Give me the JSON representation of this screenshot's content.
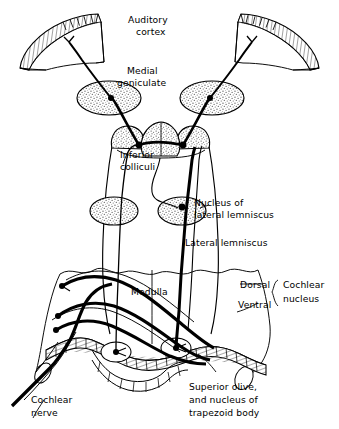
{
  "figure": {
    "type": "anatomical-diagram",
    "background_color": "#ffffff",
    "ink_color": "#000000",
    "stipple_color": "#7a7a7a",
    "width": 339,
    "height": 429
  },
  "labels": {
    "auditory_cortex": {
      "line1": "Auditory",
      "line2": "cortex"
    },
    "medial_geniculate": {
      "line1": "Medial",
      "line2": "geniculate"
    },
    "inferior_colliculi": {
      "line1": "Inferior",
      "line2": "colliculi"
    },
    "nucleus_lateral_lemniscus": {
      "line1": "Nucleus of",
      "line2": "lateral lemniscus"
    },
    "lateral_lemniscus": {
      "line1": "Lateral lemniscus"
    },
    "medulla": {
      "line1": "Medulla"
    },
    "dorsal": {
      "line1": "Dorsal"
    },
    "ventral": {
      "line1": "Ventral"
    },
    "cochlear_nucleus": {
      "line1": "Cochlear",
      "line2": "nucleus"
    },
    "cochlear_nerve": {
      "line1": "Cochlear",
      "line2": "nerve"
    },
    "superior_olive": {
      "line1": "Superior olive,",
      "line2": "and nucleus of",
      "line3": "trapezoid  body"
    }
  },
  "structures": [
    {
      "name": "auditory-cortex-left",
      "kind": "hatched-band"
    },
    {
      "name": "auditory-cortex-right",
      "kind": "hatched-band"
    },
    {
      "name": "medial-geniculate-left",
      "kind": "stippled-oval"
    },
    {
      "name": "medial-geniculate-right",
      "kind": "stippled-oval"
    },
    {
      "name": "inferior-colliculi",
      "kind": "stippled-lobes"
    },
    {
      "name": "nucleus-lateral-lemniscus-left",
      "kind": "stippled-oval"
    },
    {
      "name": "nucleus-lateral-lemniscus-right",
      "kind": "stippled-oval"
    },
    {
      "name": "brainstem-outline",
      "kind": "outline"
    },
    {
      "name": "medulla-body",
      "kind": "outline"
    },
    {
      "name": "superior-olive-band",
      "kind": "hatched-band"
    },
    {
      "name": "cochlear-nerve-trunk",
      "kind": "thick-path"
    },
    {
      "name": "lateral-lemniscus-left",
      "kind": "thin-path"
    },
    {
      "name": "lateral-lemniscus-right",
      "kind": "thick-path"
    }
  ]
}
